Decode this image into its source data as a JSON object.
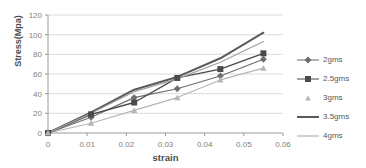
{
  "chart_data": {
    "type": "line",
    "title": "",
    "xlabel": "strain",
    "ylabel": "Stress(Mpa)",
    "xlim": [
      0,
      0.06
    ],
    "ylim": [
      0,
      120
    ],
    "grid": "horizontal",
    "legend_position": "right",
    "x_ticks": [
      "0",
      "0.01",
      "0.02",
      "0.03",
      "0.04",
      "0.05",
      "0.06"
    ],
    "y_ticks": [
      "0",
      "20",
      "40",
      "60",
      "80",
      "100",
      "120"
    ],
    "x": [
      0,
      0.011,
      0.022,
      0.033,
      0.044,
      0.055
    ],
    "series": [
      {
        "name": "2gms",
        "color": "#6e6e6e",
        "marker": "diamond",
        "width": 1.2,
        "values": [
          0,
          16,
          36,
          45,
          58,
          75
        ]
      },
      {
        "name": "2.5gms",
        "color": "#4a4a4a",
        "marker": "square",
        "width": 1.4,
        "values": [
          0,
          19,
          31,
          56,
          65,
          81
        ]
      },
      {
        "name": "3gms",
        "color": "#b5b5b5",
        "marker": "triangle",
        "width": 1.1,
        "values": [
          0,
          10,
          23,
          36,
          54,
          66
        ]
      },
      {
        "name": "3.5gms",
        "color": "#5a5a5a",
        "marker": "none",
        "width": 2.0,
        "values": [
          0,
          21,
          44,
          57,
          76,
          102
        ]
      },
      {
        "name": "4gms",
        "color": "#a0a0a0",
        "marker": "none",
        "width": 1.2,
        "values": [
          0,
          20,
          42,
          55,
          72,
          93
        ]
      }
    ]
  },
  "axes": {
    "x_title": "strain",
    "y_title": "Stress(Mpa)"
  },
  "legend": {
    "items": [
      {
        "label": "2gms"
      },
      {
        "label": "2.5gms"
      },
      {
        "label": "3gms"
      },
      {
        "label": "3.5gms"
      },
      {
        "label": "4gms"
      }
    ]
  },
  "colors": {
    "gridline": "#dcdcdc",
    "axis": "#9a9a9a",
    "tick_text": "#808080",
    "title_text": "#4d4d4d"
  }
}
